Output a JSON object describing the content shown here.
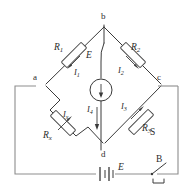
{
  "figure": {
    "ink_color": "#3a3a3a",
    "background": "#ffffff"
  },
  "nodes": [
    {
      "id": "b",
      "label": "b",
      "x": 104,
      "y": 20
    },
    {
      "id": "a",
      "label": "a",
      "x": 36,
      "y": 80
    },
    {
      "id": "c",
      "label": "c",
      "x": 158,
      "y": 80
    },
    {
      "id": "d",
      "label": "d",
      "x": 104,
      "y": 150
    }
  ],
  "components": {
    "r1": {
      "label": "R",
      "subscript": "1",
      "current": "I",
      "current_subscript": "1"
    },
    "r2": {
      "label": "R",
      "subscript": "2",
      "current": "I",
      "current_subscript": "2"
    },
    "r3": {
      "label": "R",
      "subscript": "3",
      "current": "I",
      "current_subscript": "3"
    },
    "rx": {
      "label": "R",
      "subscript": "x",
      "current": "I",
      "current_subscript": "x"
    },
    "galvanometer": {
      "label": "E",
      "current": "I",
      "current_subscript": "4"
    },
    "battery": {
      "label": "E"
    },
    "switch": {
      "label": "B"
    },
    "shunt": {
      "label": "S"
    }
  }
}
